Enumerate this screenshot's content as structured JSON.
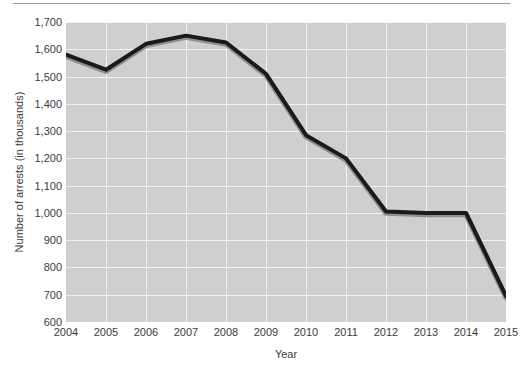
{
  "chart_data": {
    "type": "line",
    "title": "",
    "xlabel": "Year",
    "ylabel": "Number of arrests (in thousands)",
    "x": [
      2004,
      2005,
      2006,
      2007,
      2008,
      2009,
      2010,
      2011,
      2012,
      2013,
      2014,
      2015
    ],
    "categories": [
      "2004",
      "2005",
      "2006",
      "2007",
      "2008",
      "2009",
      "2010",
      "2011",
      "2012",
      "2013",
      "2014",
      "2015"
    ],
    "values": [
      1580,
      1525,
      1620,
      1650,
      1625,
      1510,
      1285,
      1200,
      1005,
      1000,
      1000,
      695
    ],
    "xtick_labels": [
      "2004",
      "2005",
      "2006",
      "2007",
      "2008",
      "2009",
      "2010",
      "2011",
      "2012",
      "2013",
      "2014",
      "2015"
    ],
    "ytick_labels": [
      "1,700",
      "1,600",
      "1,500",
      "1,400",
      "1,300",
      "1,200",
      "1,100",
      "1,000",
      "900",
      "800",
      "700",
      "600"
    ],
    "ytick_values": [
      1700,
      1600,
      1500,
      1400,
      1300,
      1200,
      1100,
      1000,
      900,
      800,
      700,
      600
    ],
    "ylim": [
      600,
      1700
    ],
    "xlim": [
      2004,
      2015
    ],
    "grid": true,
    "legend": false,
    "series": [
      {
        "name": "Number of arrests",
        "values": [
          1580,
          1525,
          1620,
          1650,
          1625,
          1510,
          1285,
          1200,
          1005,
          1000,
          1000,
          695
        ]
      }
    ],
    "colors": {
      "line": "#1a1a1a",
      "line_shadow": "#8f8f8f",
      "plot_background": "#cfcfcf",
      "gridline": "#f2f2f2",
      "text": "#3b3b3b",
      "page_background": "#ffffff",
      "top_rule": "#9a9a9a"
    },
    "line_width": 4
  }
}
